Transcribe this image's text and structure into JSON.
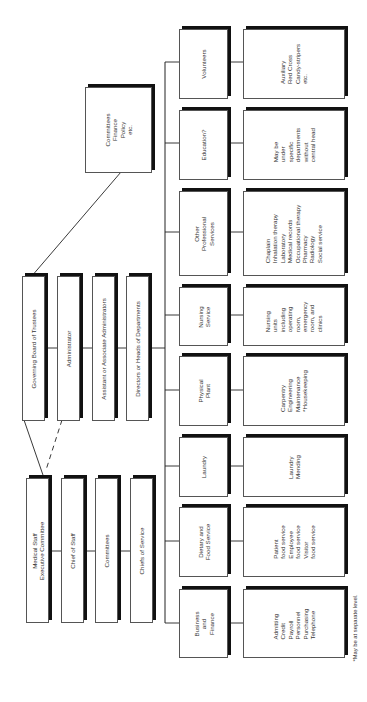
{
  "chart_title": "Hospital organization chart",
  "top_group": {
    "committees_box": {
      "lines": [
        "Committees",
        "Finance",
        "Policy",
        "etc."
      ]
    },
    "admin_chain": [
      {
        "label": "Governing Board of Trustees"
      },
      {
        "label": "Administrator"
      },
      {
        "label": "Assistant or Associate Administrators"
      },
      {
        "label": "Directors or Heads of Departments"
      }
    ],
    "medical_chain": [
      {
        "lines": [
          "Medical Staff",
          "Executive Committee"
        ]
      },
      {
        "lines": [
          "Chief of Staff"
        ]
      },
      {
        "lines": [
          "Committees"
        ]
      },
      {
        "lines": [
          "Chiefs of Service"
        ]
      }
    ]
  },
  "departments": [
    {
      "name": [
        "Volunteers"
      ],
      "details": [
        "Auxiliary",
        "Red Cross",
        "Candy-stripers",
        "etc."
      ]
    },
    {
      "name": [
        "Education?"
      ],
      "details": [
        "May be",
        "under",
        "specific",
        "departments",
        "without",
        "central head"
      ]
    },
    {
      "name": [
        "Other",
        "Professional",
        "Services"
      ],
      "details": [
        "Chaplain",
        "Inhalation therapy",
        "Laboratory",
        "Medical records",
        "Occupational therapy",
        "Pharmacy",
        "Radiology",
        "Social service"
      ]
    },
    {
      "name": [
        "Nursing",
        "Service"
      ],
      "details": [
        "Nursing",
        "units",
        "including",
        "operating",
        "room,",
        "emergency",
        "room, and",
        "clinics"
      ]
    },
    {
      "name": [
        "Physical",
        "Plant"
      ],
      "details": [
        "Carpentry",
        "Engineering",
        "Maintenance",
        "*Housekeeping"
      ]
    },
    {
      "name": [
        "Laundry"
      ],
      "details": [
        "Laundry",
        "Mending"
      ]
    },
    {
      "name": [
        "Dietary and",
        "Food Service"
      ],
      "details": [
        "Patient",
        "food service",
        "Employee",
        "food service",
        "Visitor",
        "food service"
      ]
    },
    {
      "name": [
        "Business",
        "and",
        "Finance"
      ],
      "details": [
        "Admitting",
        "Credit",
        "Payroll",
        "Personnel",
        "Purchasing",
        "Telephone"
      ]
    }
  ],
  "footnote": "*May be at separate level."
}
